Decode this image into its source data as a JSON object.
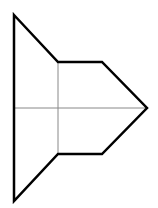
{
  "diagram": {
    "colors": {
      "background": "#ffffff",
      "outline": "#000000",
      "guide": "#888888"
    },
    "outline_points": "14,15 58,62 102,62 147,108 102,154 58,154 14,201",
    "guides": {
      "horizontal": {
        "x1": 14,
        "y1": 108,
        "x2": 147,
        "y2": 108
      },
      "vertical": {
        "x1": 58,
        "y1": 62,
        "x2": 58,
        "y2": 154
      }
    }
  }
}
